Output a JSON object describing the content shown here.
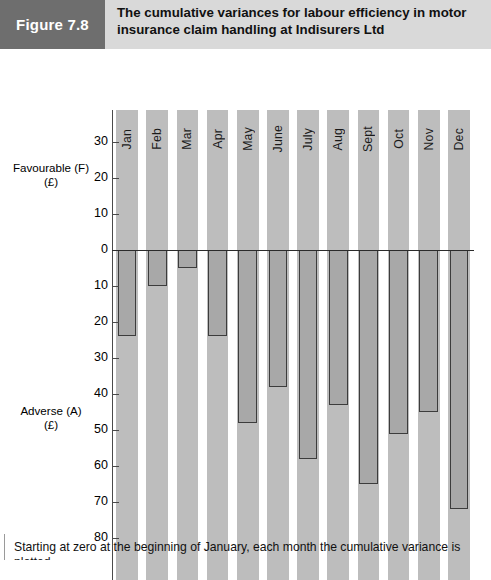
{
  "figure": {
    "tag": "Figure 7.8",
    "title": "The cumulative variances for labour efficiency in motor insurance claim handling at Indisurers Ltd"
  },
  "axes": {
    "favourable_caption_line1": "Favourable (F)",
    "favourable_caption_line2": "(£)",
    "adverse_caption_line1": "Adverse (A)",
    "adverse_caption_line2": "(£)",
    "y_ticks": [
      "30",
      "20",
      "10",
      "0",
      "10",
      "20",
      "30",
      "40",
      "50",
      "60",
      "70",
      "80"
    ]
  },
  "footer": {
    "text": "Starting at zero at the beginning of January, each month the cumulative variance is plotted"
  },
  "colors": {
    "header_band": "#d9d9d9",
    "tag_block": "#6e6e6e",
    "column_band": "#bdbdbd",
    "bar_fill": "#a8a8a8",
    "bar_outline": "#3c3c3c",
    "axis": "#4a4a4a"
  },
  "chart_data": {
    "type": "bar",
    "title": "The cumulative variances for labour efficiency in motor insurance claim handling at Indisurers Ltd",
    "xlabel": "",
    "ylabel": "Favourable (F) / Adverse (A) (£)",
    "ylim": [
      -80,
      35
    ],
    "grid": false,
    "legend": "none",
    "note": "Adverse values are plotted downward from the zero baseline; axis tick labels below zero are shown as positive magnitudes.",
    "categories": [
      "Jan",
      "Feb",
      "Mar",
      "Apr",
      "May",
      "June",
      "July",
      "Aug",
      "Sept",
      "Oct",
      "Nov",
      "Dec"
    ],
    "values": [
      -24,
      -10,
      -5,
      -24,
      -48,
      -38,
      -58,
      -43,
      -65,
      -51,
      -45,
      -72
    ],
    "series": [
      {
        "name": "Cumulative variance (£)",
        "values": [
          -24,
          -10,
          -5,
          -24,
          -48,
          -38,
          -58,
          -43,
          -65,
          -51,
          -45,
          -72
        ]
      }
    ]
  }
}
